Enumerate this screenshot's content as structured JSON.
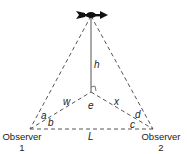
{
  "diagram": {
    "labels": {
      "h": "h",
      "w": "w",
      "e": "e",
      "x": "x",
      "a": "a",
      "b": "b",
      "c": "c",
      "d": "d",
      "L": "L"
    },
    "observers": [
      {
        "name": "Observer",
        "number": "1"
      },
      {
        "name": "Observer",
        "number": "2"
      }
    ],
    "colors": {
      "line": "#555555",
      "vane": "#111111"
    }
  }
}
